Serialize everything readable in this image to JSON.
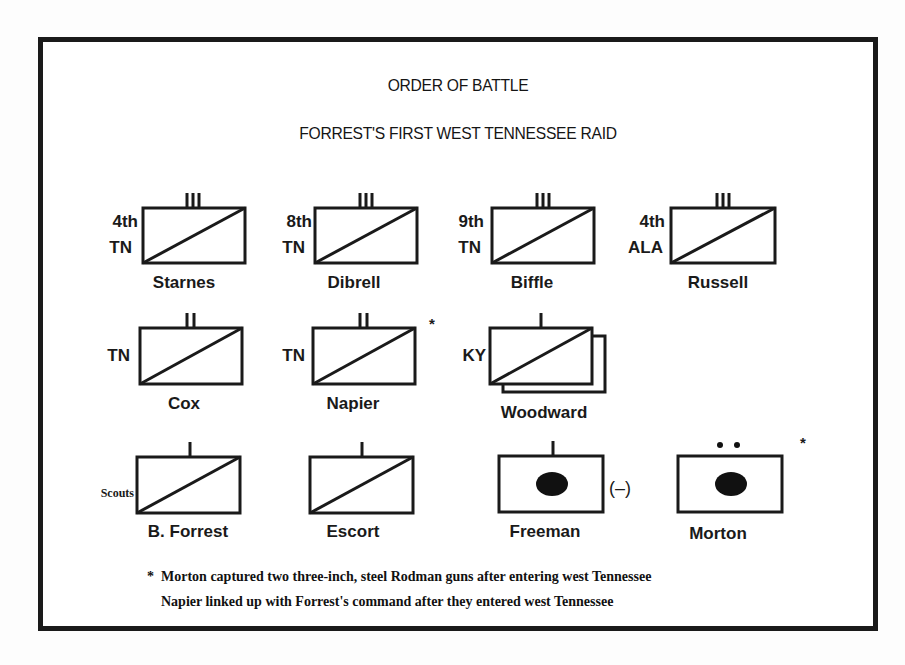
{
  "title": "ORDER OF BATTLE",
  "subtitle": "FORREST'S FIRST WEST TENNESSEE RAID",
  "units": [
    {
      "id": "starnes",
      "commander": "Starnes",
      "designation": [
        "4th",
        "TN"
      ],
      "size": "III",
      "type": "cavalry"
    },
    {
      "id": "dibrell",
      "commander": "Dibrell",
      "designation": [
        "8th",
        "TN"
      ],
      "size": "III",
      "type": "cavalry"
    },
    {
      "id": "biffle",
      "commander": "Biffle",
      "designation": [
        "9th",
        "TN"
      ],
      "size": "III",
      "type": "cavalry"
    },
    {
      "id": "russell",
      "commander": "Russell",
      "designation": [
        "4th",
        "ALA"
      ],
      "size": "III",
      "type": "cavalry"
    },
    {
      "id": "cox",
      "commander": "Cox",
      "designation": [
        "TN"
      ],
      "size": "II",
      "type": "cavalry"
    },
    {
      "id": "napier",
      "commander": "Napier",
      "designation": [
        "TN"
      ],
      "size": "II",
      "type": "cavalry",
      "note_marker": "*"
    },
    {
      "id": "woodward",
      "commander": "Woodward",
      "designation": [
        "KY"
      ],
      "size": "I",
      "type": "cavalry",
      "stacked": true
    },
    {
      "id": "bforrest",
      "commander": "B. Forrest",
      "designation": [
        "Scouts"
      ],
      "size": "I",
      "type": "cavalry"
    },
    {
      "id": "escort",
      "commander": "Escort",
      "designation": [],
      "size": "I",
      "type": "cavalry"
    },
    {
      "id": "freeman",
      "commander": "Freeman",
      "designation": [],
      "size": "I",
      "type": "artillery",
      "modifier": "(–)"
    },
    {
      "id": "morton",
      "commander": "Morton",
      "designation": [],
      "size": "••",
      "type": "artillery",
      "note_marker": "*"
    }
  ],
  "notes": {
    "marker": "*",
    "line1": "Morton captured two three-inch, steel Rodman guns after entering west Tennessee",
    "line2": "Napier linked up with Forrest's command after they entered west Tennessee"
  }
}
